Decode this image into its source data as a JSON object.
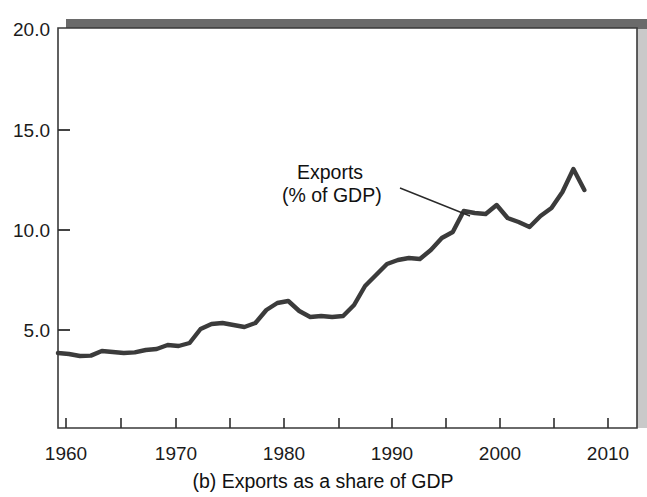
{
  "figure": {
    "caption": "(b) Exports as a share of GDP",
    "panel_label": "(b)",
    "background_color": "#ffffff",
    "plot_border_color": "#3a3a3a",
    "shadow_color": "#6e6e6e",
    "line_color": "#3b3b3b"
  },
  "annotation": {
    "line1": "Exports",
    "line2": "(% of GDP)"
  },
  "chart_data": {
    "type": "line",
    "title": "(b) Exports as a share of GDP",
    "xlabel": "",
    "ylabel": "",
    "xlim": [
      1960,
      2012.8
    ],
    "ylim": [
      0.0,
      20.0
    ],
    "grid": false,
    "legend": "annotation-callout",
    "y_ticks": [
      5.0,
      10.0,
      15.0,
      20.0
    ],
    "y_tick_labels": [
      "5.0",
      "10.0",
      "15.0",
      "20.0"
    ],
    "x_ticks": [
      1960,
      1965,
      1970,
      1975,
      1980,
      1985,
      1990,
      1995,
      2000,
      2005,
      2010
    ],
    "x_tick_labels_shown": [
      "1960",
      "1970",
      "1980",
      "1990",
      "2000",
      "2010"
    ],
    "x_labeled_ticks": [
      1960,
      1970,
      1980,
      1990,
      2000,
      2010
    ],
    "series": [
      {
        "name": "Exports (% of GDP)",
        "x": [
          1960,
          1961,
          1962,
          1963,
          1964,
          1965,
          1966,
          1967,
          1968,
          1969,
          1970,
          1971,
          1972,
          1973,
          1974,
          1975,
          1976,
          1977,
          1978,
          1979,
          1980,
          1981,
          1982,
          1983,
          1984,
          1985,
          1986,
          1987,
          1988,
          1989,
          1990,
          1991,
          1992,
          1993,
          1994,
          1995,
          1996,
          1997,
          1998,
          1999,
          2000,
          2001,
          2002,
          2003,
          2004,
          2005,
          2006,
          2007,
          2008
        ],
        "values": [
          3.75,
          3.7,
          3.6,
          3.62,
          3.85,
          3.8,
          3.75,
          3.78,
          3.9,
          3.95,
          4.15,
          4.1,
          4.25,
          4.95,
          5.2,
          5.25,
          5.15,
          5.05,
          5.25,
          5.9,
          6.25,
          6.35,
          5.85,
          5.55,
          5.6,
          5.55,
          5.6,
          6.15,
          7.1,
          7.65,
          8.2,
          8.4,
          8.5,
          8.45,
          8.9,
          9.5,
          9.8,
          10.85,
          10.75,
          10.7,
          11.15,
          10.5,
          10.3,
          10.05,
          10.6,
          11.0,
          11.8,
          12.95,
          11.9
        ]
      }
    ]
  }
}
